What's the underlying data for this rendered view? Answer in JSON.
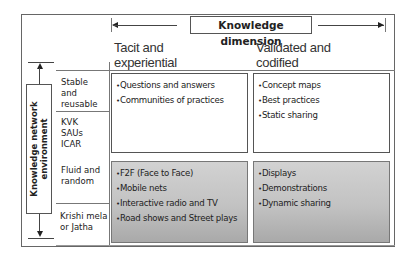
{
  "diagram": {
    "horizontal_axis": {
      "title": "Knowledge dimension",
      "columns": [
        {
          "label_line1": "Tacit and",
          "label_line2": "experiential"
        },
        {
          "label_line1": "Validated and",
          "label_line2": "codified"
        }
      ]
    },
    "vertical_axis": {
      "title_line1": "Knowledge network",
      "title_line2": "environment",
      "rows": [
        {
          "label_lines": [
            "Stable",
            "and",
            "reusable"
          ],
          "sub_lines": [
            "KVK",
            "SAUs",
            "ICAR"
          ]
        },
        {
          "label_lines": [
            "Fluid and",
            "random"
          ],
          "sub_lines": [
            "Krishi mela",
            "or Jatha"
          ]
        }
      ]
    },
    "cells": {
      "stable_tacit": [
        "Questions and answers",
        "Communities of practices"
      ],
      "stable_codified": [
        "Concept maps",
        "Best practices",
        "Static sharing"
      ],
      "fluid_tacit": [
        "F2F (Face to Face)",
        "Mobile nets",
        "Interactive radio and TV",
        "Road shows and Street plays"
      ],
      "fluid_codified": [
        "Displays",
        "Demonstrations",
        "Dynamic sharing"
      ]
    },
    "colors": {
      "border": "#555555",
      "shaded_cell_top": "#d2d2d2",
      "shaded_cell_bottom": "#a9a9a9"
    }
  }
}
